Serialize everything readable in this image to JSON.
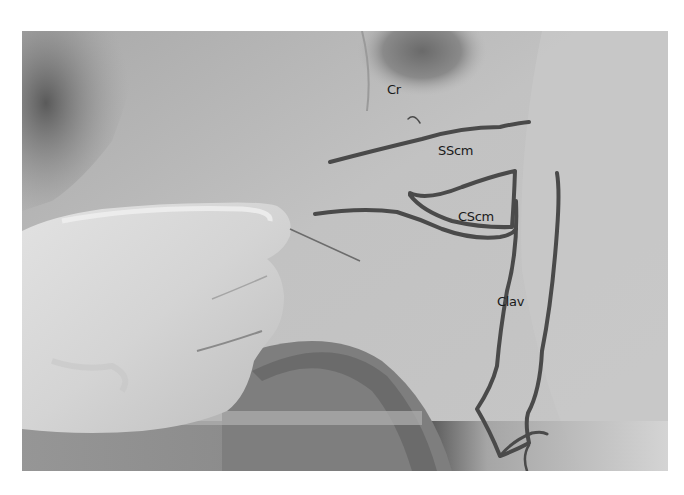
{
  "figure": {
    "type": "clinical photograph",
    "colors": {
      "background": "#ffffff",
      "skin": "#bcbcbc",
      "marker": "#4a4a4a",
      "label_text": "#1a1a1a"
    },
    "labels": [
      {
        "id": "cr",
        "text": "Cr"
      },
      {
        "id": "sscm",
        "text": "SScm"
      },
      {
        "id": "cscm",
        "text": "CScm"
      },
      {
        "id": "clav",
        "text": "Clav"
      }
    ]
  }
}
